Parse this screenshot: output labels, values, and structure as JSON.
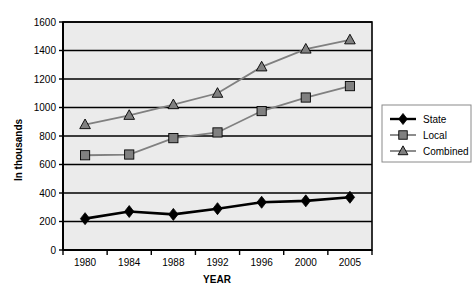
{
  "chart_data": {
    "type": "line",
    "title": "",
    "xlabel": "YEAR",
    "ylabel": "In thousands",
    "categories": [
      "1980",
      "1984",
      "1988",
      "1992",
      "1996",
      "2000",
      "2005"
    ],
    "ylim": [
      0,
      1600
    ],
    "ytick_step": 200,
    "yticks": [
      "0",
      "200",
      "400",
      "600",
      "800",
      "1000",
      "1200",
      "1400",
      "1600"
    ],
    "grid": true,
    "legend_position": "right",
    "series": [
      {
        "name": "State",
        "marker": "diamond",
        "color": "#000000",
        "values": [
          220,
          270,
          250,
          290,
          335,
          345,
          370
        ]
      },
      {
        "name": "Local",
        "marker": "square",
        "color": "#808080",
        "values": [
          665,
          670,
          785,
          825,
          975,
          1070,
          1150
        ]
      },
      {
        "name": "Combined",
        "marker": "triangle",
        "color": "#808080",
        "values": [
          880,
          945,
          1020,
          1100,
          1285,
          1410,
          1475
        ]
      }
    ]
  },
  "legend": {
    "items": [
      {
        "label": "State"
      },
      {
        "label": "Local"
      },
      {
        "label": "Combined"
      }
    ]
  },
  "axes": {
    "y_title": "In thousands",
    "x_title": "YEAR"
  },
  "colors": {
    "plot_background": "#ebebeb",
    "gridline": "#000000",
    "state": "#000000",
    "local": "#808080",
    "combined": "#808080",
    "marker_stroke": "#000000"
  }
}
